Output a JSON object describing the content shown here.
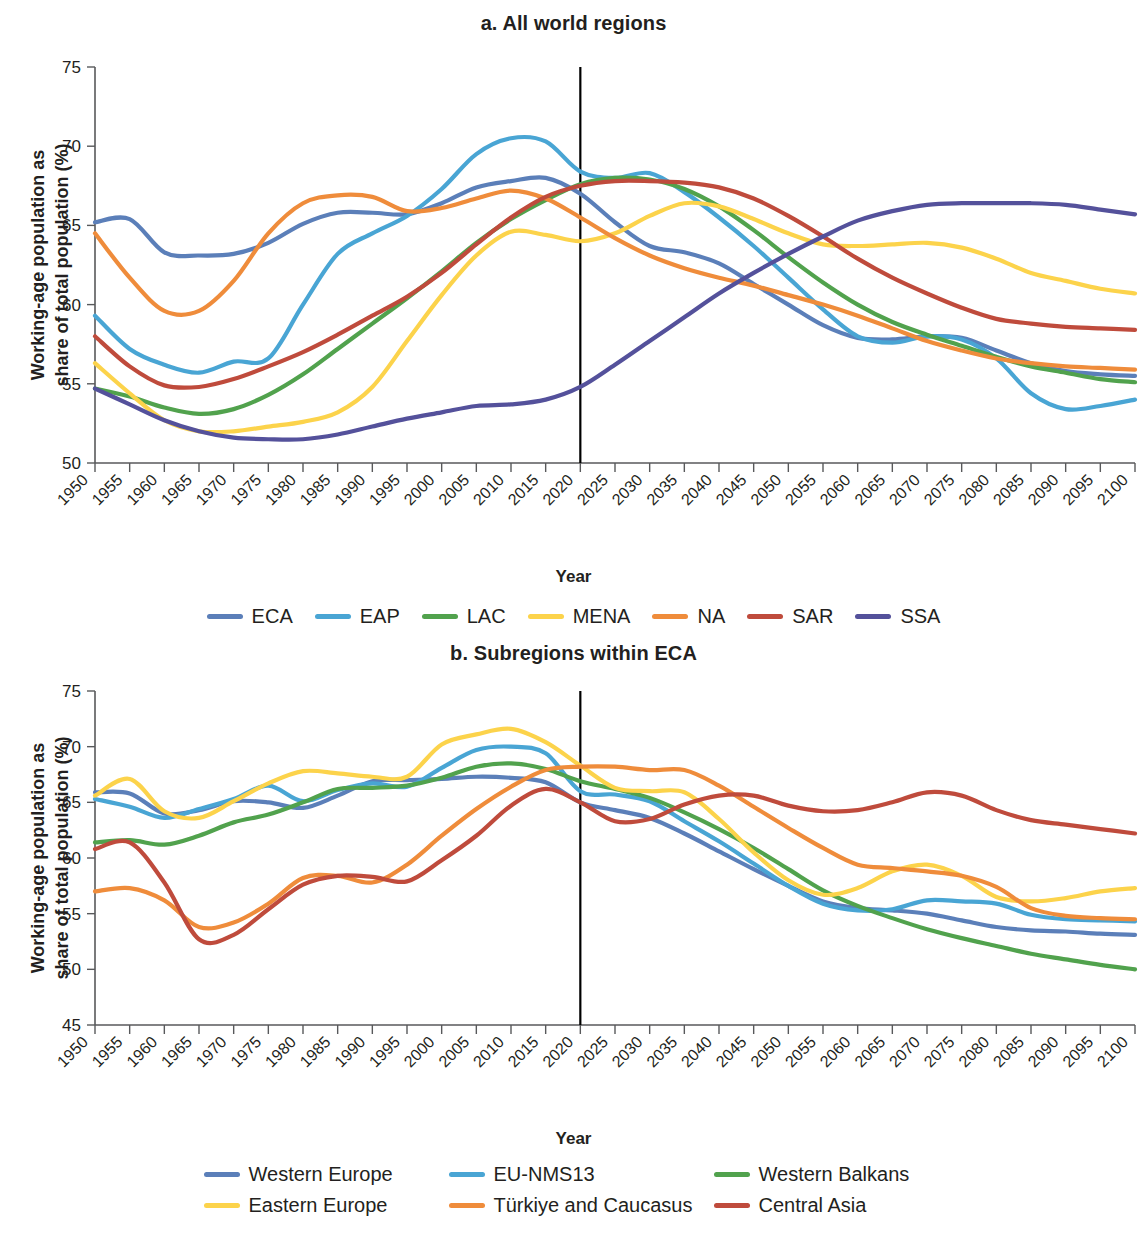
{
  "figure": {
    "xlabel": "Year",
    "ylabel_line1": "Working-age population as",
    "ylabel_line2": "share of total population (%)"
  },
  "panel_a": {
    "title": "a. All world regions"
  },
  "panel_b": {
    "title": "b. Subregions within ECA"
  },
  "chart_data": [
    {
      "type": "line",
      "title": "a. All world regions",
      "xlabel": "Year",
      "ylabel": "Working-age population as share of total population (%)",
      "xlim": [
        1950,
        2100
      ],
      "ylim": [
        50,
        75
      ],
      "yticks": [
        50,
        55,
        60,
        65,
        70,
        75
      ],
      "grid": false,
      "legend_position": "bottom",
      "annotations": [
        {
          "type": "vertical-line",
          "x": 2020,
          "label": ""
        }
      ],
      "x": [
        1950,
        1955,
        1960,
        1965,
        1970,
        1975,
        1980,
        1985,
        1990,
        1995,
        2000,
        2005,
        2010,
        2015,
        2020,
        2025,
        2030,
        2035,
        2040,
        2045,
        2050,
        2055,
        2060,
        2065,
        2070,
        2075,
        2080,
        2085,
        2090,
        2095,
        2100
      ],
      "series": [
        {
          "name": "ECA",
          "color": "#5b7fb9",
          "values": [
            65.2,
            65.4,
            63.3,
            63.1,
            63.2,
            63.9,
            65.1,
            65.8,
            65.8,
            65.7,
            66.4,
            67.4,
            67.8,
            68.0,
            67.0,
            65.2,
            63.7,
            63.3,
            62.6,
            61.3,
            60.0,
            58.7,
            57.9,
            57.8,
            58.0,
            57.9,
            57.1,
            56.3,
            55.8,
            55.6,
            55.5
          ]
        },
        {
          "name": "EAP",
          "color": "#49a5d4",
          "values": [
            59.3,
            57.2,
            56.2,
            55.7,
            56.4,
            56.6,
            60.0,
            63.2,
            64.5,
            65.6,
            67.3,
            69.5,
            70.5,
            70.3,
            68.4,
            68.0,
            68.3,
            67.1,
            65.5,
            63.7,
            61.7,
            59.7,
            58.0,
            57.6,
            58.0,
            57.8,
            56.6,
            54.4,
            53.4,
            53.6,
            54.0
          ]
        },
        {
          "name": "LAC",
          "color": "#51a24d",
          "values": [
            54.7,
            54.2,
            53.5,
            53.1,
            53.4,
            54.3,
            55.6,
            57.2,
            58.8,
            60.4,
            62.1,
            63.9,
            65.4,
            66.6,
            67.6,
            68.0,
            67.9,
            67.3,
            66.2,
            64.7,
            63.0,
            61.4,
            60.0,
            58.9,
            58.1,
            57.4,
            56.7,
            56.1,
            55.7,
            55.3,
            55.1
          ]
        },
        {
          "name": "MENA",
          "color": "#fcd34b",
          "values": [
            56.3,
            54.4,
            52.7,
            52.0,
            52.0,
            52.3,
            52.6,
            53.2,
            54.8,
            57.7,
            60.6,
            63.1,
            64.6,
            64.4,
            64.0,
            64.5,
            65.6,
            66.4,
            66.2,
            65.4,
            64.5,
            63.8,
            63.7,
            63.8,
            63.9,
            63.6,
            62.9,
            62.0,
            61.5,
            61.0,
            60.7
          ]
        },
        {
          "name": "NA",
          "color": "#ef8c3b",
          "values": [
            64.5,
            61.7,
            59.6,
            59.6,
            61.5,
            64.5,
            66.4,
            66.9,
            66.8,
            65.9,
            66.1,
            66.7,
            67.2,
            66.7,
            65.5,
            64.2,
            63.1,
            62.3,
            61.7,
            61.2,
            60.6,
            60.0,
            59.3,
            58.5,
            57.7,
            57.1,
            56.6,
            56.3,
            56.1,
            56.0,
            55.9
          ]
        },
        {
          "name": "SAR",
          "color": "#bf4b3c",
          "values": [
            58.0,
            56.1,
            54.9,
            54.8,
            55.3,
            56.1,
            57.0,
            58.1,
            59.3,
            60.5,
            62.0,
            63.8,
            65.5,
            66.8,
            67.5,
            67.8,
            67.8,
            67.7,
            67.4,
            66.7,
            65.6,
            64.3,
            62.9,
            61.7,
            60.7,
            59.8,
            59.1,
            58.8,
            58.6,
            58.5,
            58.4
          ]
        },
        {
          "name": "SSA",
          "color": "#54519b",
          "values": [
            54.7,
            53.7,
            52.7,
            52.0,
            51.6,
            51.5,
            51.5,
            51.8,
            52.3,
            52.8,
            53.2,
            53.6,
            53.7,
            54.0,
            54.8,
            56.2,
            57.7,
            59.2,
            60.7,
            62.0,
            63.2,
            64.3,
            65.3,
            65.9,
            66.3,
            66.4,
            66.4,
            66.4,
            66.3,
            66.0,
            65.7
          ]
        }
      ]
    },
    {
      "type": "line",
      "title": "b. Subregions within ECA",
      "xlabel": "Year",
      "ylabel": "Working-age population as share of total population (%)",
      "xlim": [
        1950,
        2100
      ],
      "ylim": [
        45,
        75
      ],
      "yticks": [
        45,
        50,
        55,
        60,
        65,
        70,
        75
      ],
      "grid": false,
      "legend_position": "bottom",
      "annotations": [
        {
          "type": "vertical-line",
          "x": 2020,
          "label": ""
        }
      ],
      "x": [
        1950,
        1955,
        1960,
        1965,
        1970,
        1975,
        1980,
        1985,
        1990,
        1995,
        2000,
        2005,
        2010,
        2015,
        2020,
        2025,
        2030,
        2035,
        2040,
        2045,
        2050,
        2055,
        2060,
        2065,
        2070,
        2075,
        2080,
        2085,
        2090,
        2095,
        2100
      ],
      "series": [
        {
          "name": "Western Europe",
          "color": "#5b7fb9",
          "values": [
            65.9,
            65.8,
            64.0,
            64.3,
            65.1,
            65.0,
            64.5,
            65.6,
            66.9,
            67.0,
            67.1,
            67.3,
            67.2,
            66.8,
            65.0,
            64.3,
            63.6,
            62.2,
            60.6,
            59.0,
            57.5,
            56.1,
            55.5,
            55.3,
            55.0,
            54.4,
            53.8,
            53.5,
            53.4,
            53.2,
            53.1
          ]
        },
        {
          "name": "EU-NMS13",
          "color": "#49a5d4",
          "values": [
            65.3,
            64.6,
            63.6,
            64.4,
            65.3,
            66.5,
            65.1,
            66.1,
            66.7,
            66.4,
            68.1,
            69.7,
            70.0,
            69.4,
            66.0,
            65.7,
            65.1,
            63.3,
            61.5,
            59.5,
            57.5,
            55.9,
            55.3,
            55.4,
            56.2,
            56.1,
            55.9,
            54.9,
            54.5,
            54.4,
            54.3
          ]
        },
        {
          "name": "Western Balkans",
          "color": "#51a24d",
          "values": [
            61.4,
            61.6,
            61.2,
            62.0,
            63.2,
            63.9,
            65.0,
            66.2,
            66.3,
            66.5,
            67.2,
            68.2,
            68.5,
            68.0,
            66.9,
            66.2,
            65.4,
            64.1,
            62.6,
            60.9,
            59.0,
            57.1,
            55.7,
            54.6,
            53.6,
            52.8,
            52.1,
            51.4,
            50.9,
            50.4,
            50.0
          ]
        },
        {
          "name": "Eastern Europe",
          "color": "#fcd34b",
          "values": [
            65.6,
            67.1,
            64.2,
            63.6,
            65.1,
            66.7,
            67.8,
            67.6,
            67.3,
            67.3,
            70.2,
            71.1,
            71.6,
            70.4,
            68.3,
            66.3,
            66.0,
            65.9,
            63.5,
            60.5,
            58.0,
            56.7,
            57.3,
            58.8,
            59.4,
            58.4,
            56.5,
            56.1,
            56.4,
            57.0,
            57.3
          ]
        },
        {
          "name": "Türkiye and Caucasus",
          "color": "#ef8c3b",
          "values": [
            57.0,
            57.3,
            56.2,
            53.8,
            54.2,
            55.9,
            58.2,
            58.4,
            57.8,
            59.4,
            62.0,
            64.4,
            66.4,
            67.9,
            68.2,
            68.2,
            67.9,
            67.9,
            66.5,
            64.6,
            62.7,
            60.9,
            59.4,
            59.1,
            58.8,
            58.4,
            57.4,
            55.5,
            54.8,
            54.6,
            54.5
          ]
        },
        {
          "name": "Central Asia",
          "color": "#bf4b3c",
          "values": [
            60.8,
            61.4,
            57.8,
            52.7,
            53.1,
            55.4,
            57.6,
            58.4,
            58.3,
            57.9,
            59.8,
            62.0,
            64.7,
            66.2,
            65.0,
            63.3,
            63.5,
            64.8,
            65.6,
            65.6,
            64.7,
            64.2,
            64.3,
            65.0,
            65.9,
            65.6,
            64.3,
            63.4,
            63.0,
            62.6,
            62.2
          ]
        }
      ]
    }
  ],
  "legend_a": [
    {
      "label": "ECA",
      "color": "#5b7fb9"
    },
    {
      "label": "EAP",
      "color": "#49a5d4"
    },
    {
      "label": "LAC",
      "color": "#51a24d"
    },
    {
      "label": "MENA",
      "color": "#fcd34b"
    },
    {
      "label": "NA",
      "color": "#ef8c3b"
    },
    {
      "label": "SAR",
      "color": "#bf4b3c"
    },
    {
      "label": "SSA",
      "color": "#54519b"
    }
  ],
  "legend_b": [
    {
      "label": "Western Europe",
      "color": "#5b7fb9"
    },
    {
      "label": "EU-NMS13",
      "color": "#49a5d4"
    },
    {
      "label": "Western Balkans",
      "color": "#51a24d"
    },
    {
      "label": "Eastern Europe",
      "color": "#fcd34b"
    },
    {
      "label": "Türkiye and Caucasus",
      "color": "#ef8c3b"
    },
    {
      "label": "Central Asia",
      "color": "#bf4b3c"
    }
  ]
}
